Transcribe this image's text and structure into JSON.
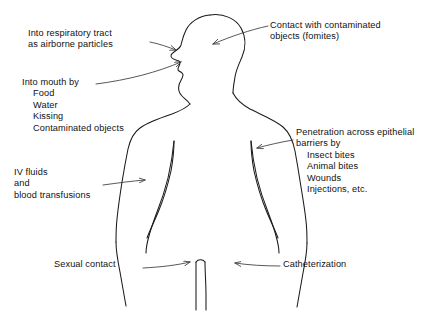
{
  "diagram": {
    "colors": {
      "background": "#ffffff",
      "outline": "#1a1a1a",
      "text": "#111111",
      "arrow": "#3a3a3a"
    },
    "labels": {
      "respiratory": {
        "line1": "Into respiratory tract",
        "line2": "as airborne particles"
      },
      "fomites": {
        "line1": "Contact with contaminated",
        "line2": "objects (fomites)"
      },
      "mouth": {
        "heading": "Into mouth by",
        "items": [
          "Food",
          "Water",
          "Kissing",
          "Contaminated objects"
        ]
      },
      "penetration": {
        "line1": "Penetration across epithelial",
        "line2": "barriers by",
        "items": [
          "Insect bites",
          "Animal bites",
          "Wounds",
          "Injections, etc."
        ]
      },
      "iv": {
        "line1": "IV fluids",
        "line2": "and",
        "line3": "blood transfusions"
      },
      "sexual": {
        "line1": "Sexual contact"
      },
      "catheter": {
        "line1": "Catheterization"
      }
    }
  }
}
